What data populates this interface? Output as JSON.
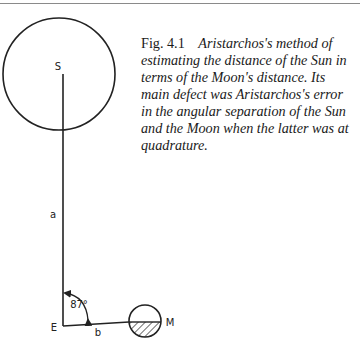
{
  "figure": {
    "number": "Fig. 4.1",
    "caption": "Aristarchos's method of estimating the distance of the Sun in terms of the Moon's distance. Its main defect was Aristarchos's error in the angular separation of the Sun and the Moon when the latter was at quadrature.",
    "labels": {
      "sun": "S",
      "earth": "E",
      "moon": "M",
      "sun_distance": "a",
      "moon_distance": "b",
      "angle": "87°"
    },
    "colors": {
      "line": "#222222",
      "rule": "#8a8a8a"
    }
  }
}
